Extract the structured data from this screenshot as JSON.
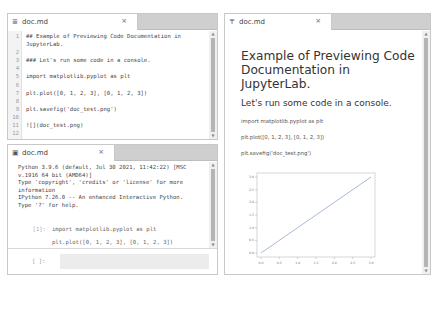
{
  "editor": {
    "tab": {
      "label": "doc.md",
      "icon": "markdown-file-icon",
      "close": "×"
    },
    "lines": [
      {
        "n": "1",
        "text": "## Example of Previewing Code Documentation in"
      },
      {
        "n": "",
        "text": "JupyterLab."
      },
      {
        "n": "2",
        "text": ""
      },
      {
        "n": "3",
        "text": "### Let's run some code in a console."
      },
      {
        "n": "4",
        "text": ""
      },
      {
        "n": "5",
        "text": "import matplotlib.pyplot as plt"
      },
      {
        "n": "6",
        "text": ""
      },
      {
        "n": "7",
        "text": "plt.plot([0, 1, 2, 3], [0, 1, 2, 3])"
      },
      {
        "n": "8",
        "text": ""
      },
      {
        "n": "9",
        "text": "plt.savefig('doc_test.png')"
      },
      {
        "n": "10",
        "text": ""
      },
      {
        "n": "11",
        "text": "![](doc_test.png)"
      },
      {
        "n": "12",
        "text": ""
      }
    ]
  },
  "console": {
    "tab": {
      "label": "doc.md",
      "icon": "console-icon",
      "close": "×"
    },
    "banner": "Python 3.9.6 (default, Jul 30 2021, 11:42:22) [MSC\nv.1916 64 bit (AMD64)]\nType 'copyright', 'credits' or 'license' for more\ninformation\nIPython 7.26.0 -- An enhanced Interactive Python.\nType '?' for help.",
    "cell": {
      "prompt": "[1]:",
      "lines": [
        "import matplotlib.pyplot as plt",
        "plt.plot([0, 1, 2, 3], [0, 1, 2, 3])",
        "plt.savefig('doc_test.png')"
      ]
    },
    "input": {
      "prompt": "[ ]:",
      "value": ""
    }
  },
  "preview": {
    "tab": {
      "label": "doc.md",
      "icon": "preview-icon",
      "close": "×"
    },
    "h1": "Example of Previewing Code Documentation in JupyterLab.",
    "h3": "Let's run some code in a console.",
    "paragraphs": [
      "import matplotlib.pyplot as plt",
      "plt.plot([0, 1, 2, 3], [0, 1, 2, 3])",
      "plt.savefig('doc_test.png')"
    ]
  },
  "chart_data": {
    "type": "line",
    "title": "",
    "xlabel": "",
    "ylabel": "",
    "x": [
      0,
      1,
      2,
      3
    ],
    "series": [
      {
        "name": "line",
        "values": [
          0,
          1,
          2,
          3
        ],
        "color": "#8fa8c8"
      }
    ],
    "xticks": [
      "0.0",
      "0.5",
      "1.0",
      "1.5",
      "2.0",
      "2.5",
      "3.0"
    ],
    "yticks": [
      "0.0",
      "0.5",
      "1.0",
      "1.5",
      "2.0",
      "2.5",
      "3.0"
    ],
    "xlim": [
      0,
      3
    ],
    "ylim": [
      0,
      3
    ],
    "grid": false,
    "legend": false
  }
}
